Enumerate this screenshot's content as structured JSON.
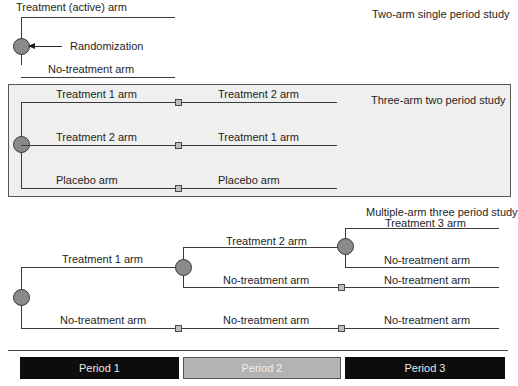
{
  "diagram": {
    "type": "study-design-diagram",
    "colors": {
      "node_fill": "#8a8a8a",
      "line": "#3a3a3a",
      "box_fill": "#efefef",
      "period_dark": "#0d0d0d",
      "period_light": "#b3b3b3"
    }
  },
  "two_arm": {
    "title": "Two-arm single period study",
    "randomization_label": "Randomization",
    "arms": [
      {
        "label": "Treatment (active) arm"
      },
      {
        "label": "No-treatment arm"
      }
    ]
  },
  "three_arm": {
    "title": "Three-arm two period study",
    "arms": [
      {
        "period1": "Treatment 1 arm",
        "period2": "Treatment 2 arm"
      },
      {
        "period1": "Treatment 2 arm",
        "period2": "Treatment 1 arm"
      },
      {
        "period1": "Placebo arm",
        "period2": "Placebo arm"
      }
    ]
  },
  "multi_arm": {
    "title": "Multiple-arm three period study",
    "period1": {
      "upper": "Treatment 1 arm",
      "lower": "No-treatment arm"
    },
    "period2": {
      "upper": "Treatment 2 arm",
      "middle": "No-treatment arm",
      "lower": "No-treatment arm"
    },
    "period3": {
      "top": "Treatment 3 arm",
      "upper_mid": "No-treatment arm",
      "lower_mid": "No-treatment arm",
      "bottom": "No-treatment arm"
    }
  },
  "periods": [
    {
      "label": "Period 1"
    },
    {
      "label": "Period 2"
    },
    {
      "label": "Period 3"
    }
  ]
}
